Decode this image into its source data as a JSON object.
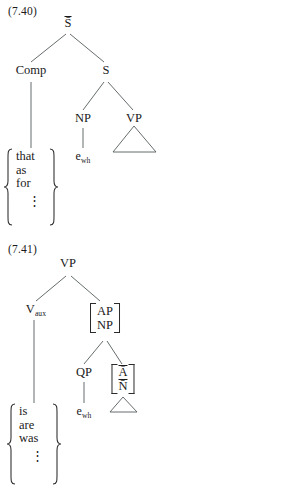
{
  "page": {
    "background_color": "#ffffff",
    "ink_color": "#1a1a1a",
    "line_color": "#555b5e",
    "type": "syntax-tree-figures"
  },
  "figures": [
    {
      "id": "7.40",
      "number_label": "(7.40)",
      "root": "S̄",
      "nodes": {
        "root_label": "S̄",
        "comp_label": "Comp",
        "s_label": "S",
        "np_label": "NP",
        "vp_label": "VP",
        "trace_label_base": "e",
        "trace_label_sub": "wh"
      },
      "brace": {
        "items": [
          "that",
          "as",
          "for"
        ],
        "ellipsis": "⋮"
      },
      "triangle": "vp-triangle"
    },
    {
      "id": "7.41",
      "number_label": "(7.41)",
      "root": "VP",
      "nodes": {
        "root_label": "VP",
        "vaux_label_base": "V",
        "vaux_label_sub": "aux",
        "qp_label": "QP",
        "trace_label_base": "e",
        "trace_label_sub": "wh"
      },
      "bracket_ap_np": {
        "top": "AP",
        "bottom": "NP"
      },
      "bracket_abar_nbar": {
        "top": "Ā",
        "bottom": "N̄"
      },
      "brace": {
        "items": [
          "is",
          "are",
          "was"
        ],
        "ellipsis": "⋮"
      },
      "triangle": "abar-nbar-triangle"
    }
  ]
}
